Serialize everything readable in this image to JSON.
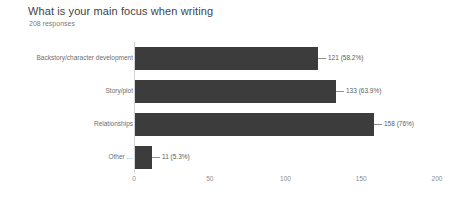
{
  "header": {
    "title": "What is your main focus when writing",
    "subtitle": "208 responses"
  },
  "colors": {
    "bar": "#3c3c3c",
    "title_text": "#434343",
    "subtitle_text": "#7a7a7a",
    "label_text": "#6d6d6d",
    "tick_text": "#8b8b8b",
    "axis_line": "#d4d4d4",
    "background": "#ffffff"
  },
  "chart_data": {
    "type": "bar",
    "orientation": "horizontal",
    "title": "What is your main focus when writing",
    "subtitle": "208 responses",
    "total_responses": 208,
    "xlabel": "",
    "ylabel": "",
    "xlim": [
      0,
      200
    ],
    "xticks": [
      0,
      50,
      100,
      150,
      200
    ],
    "xtick_labels": [
      "0",
      "50",
      "100",
      "150",
      "200"
    ],
    "grid": false,
    "legend": false,
    "categories": [
      "Backstory/character development",
      "Story/plot",
      "Relationships",
      "Other …"
    ],
    "values": [
      121,
      133,
      158,
      11
    ],
    "percents": [
      "58.2%",
      "63.9%",
      "76%",
      "5.3%"
    ],
    "data_labels": [
      "121 (58.2%)",
      "133 (63.9%)",
      "158 (76%)",
      "11 (5.3%)"
    ]
  }
}
